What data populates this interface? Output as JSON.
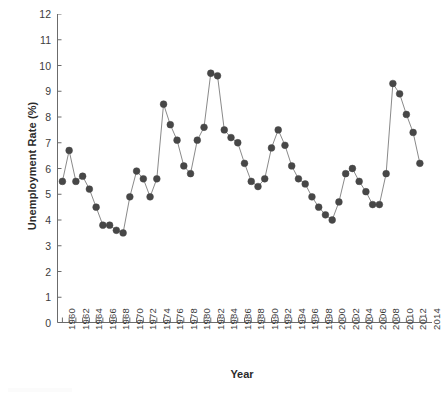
{
  "chart_data": {
    "type": "line",
    "title": "",
    "subtitle": "",
    "xlabel": "Year",
    "ylabel": "Unemployment Rate (%)",
    "xlim": [
      1959.2,
      2014.8
    ],
    "ylim": [
      0,
      12
    ],
    "grid": false,
    "legend": null,
    "legend_position": "none",
    "marker": "filled-circle",
    "marker_color": "#474747",
    "line_color": "#8a8a8a",
    "y_ticks": [
      0,
      1,
      2,
      3,
      4,
      5,
      6,
      7,
      8,
      9,
      10,
      11,
      12
    ],
    "y_tick_labels": [
      "0",
      "1",
      "2",
      "3",
      "4",
      "5",
      "6",
      "7",
      "8",
      "9",
      "10",
      "11",
      "12"
    ],
    "x_tick_labels": [
      "1960",
      "1962",
      "1964",
      "1966",
      "1968",
      "1970",
      "1972",
      "1974",
      "1976",
      "1978",
      "1980",
      "1982",
      "1984",
      "1986",
      "1988",
      "1990",
      "1992",
      "1994",
      "1996",
      "1998",
      "2000",
      "2002",
      "2004",
      "2006",
      "2008",
      "2010",
      "2012",
      "2014"
    ],
    "x_tick_label_interval_years": 2,
    "x_minor_tick_interval_years": 1,
    "x": [
      1960,
      1961,
      1962,
      1963,
      1964,
      1965,
      1966,
      1967,
      1968,
      1969,
      1970,
      1971,
      1972,
      1973,
      1974,
      1975,
      1976,
      1977,
      1978,
      1979,
      1980,
      1981,
      1982,
      1983,
      1984,
      1985,
      1986,
      1987,
      1988,
      1989,
      1990,
      1991,
      1992,
      1993,
      1994,
      1995,
      1996,
      1997,
      1998,
      1999,
      2000,
      2001,
      2002,
      2003,
      2004,
      2005,
      2006,
      2007,
      2008,
      2009,
      2010,
      2011,
      2012,
      2013
    ],
    "values": [
      5.5,
      6.7,
      5.5,
      5.7,
      5.2,
      4.5,
      3.8,
      3.8,
      3.6,
      3.5,
      4.9,
      5.9,
      5.6,
      4.9,
      5.6,
      8.5,
      7.7,
      7.1,
      6.1,
      5.8,
      7.1,
      7.6,
      9.7,
      9.6,
      7.5,
      7.2,
      7.0,
      6.2,
      5.5,
      5.3,
      5.6,
      6.8,
      7.5,
      6.9,
      6.1,
      5.6,
      5.4,
      4.9,
      4.5,
      4.2,
      4.0,
      4.7,
      5.8,
      6.0,
      5.5,
      5.1,
      4.6,
      4.6,
      5.8,
      9.3,
      8.9,
      8.1,
      7.4,
      6.2
    ],
    "series": [
      {
        "name": "Unemployment Rate",
        "values": [
          5.5,
          6.7,
          5.5,
          5.7,
          5.2,
          4.5,
          3.8,
          3.8,
          3.6,
          3.5,
          4.9,
          5.9,
          5.6,
          4.9,
          5.6,
          8.5,
          7.7,
          7.1,
          6.1,
          5.8,
          7.1,
          7.6,
          9.7,
          9.6,
          7.5,
          7.2,
          7.0,
          6.2,
          5.5,
          5.3,
          5.6,
          6.8,
          7.5,
          6.9,
          6.1,
          5.6,
          5.4,
          4.9,
          4.5,
          4.2,
          4.0,
          4.7,
          5.8,
          6.0,
          5.5,
          5.1,
          4.6,
          4.6,
          5.8,
          9.3,
          8.9,
          8.1,
          7.4,
          6.2
        ]
      }
    ]
  }
}
